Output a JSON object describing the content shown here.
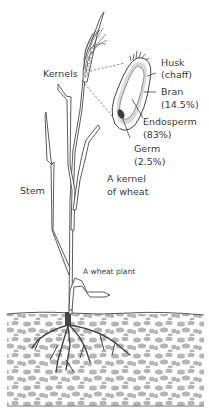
{
  "figure": {
    "title_fragment": "",
    "labels": {
      "kernels": "Kernels",
      "husk": "Husk",
      "husk_alt": "(chaff)",
      "bran": "Bran",
      "bran_pct": "(14.5%)",
      "endosperm": "Endosperm",
      "endosperm_pct": "(83%)",
      "germ": "Germ",
      "germ_pct": "(2.5%)",
      "kernel_caption_1": "A kernel",
      "kernel_caption_2": "of wheat",
      "stem": "Stem",
      "plant_caption": "A wheat plant"
    },
    "kernel_composition": [
      {
        "part": "Bran",
        "percent": 14.5
      },
      {
        "part": "Endosperm",
        "percent": 83
      },
      {
        "part": "Germ",
        "percent": 2.5
      }
    ],
    "colors": {
      "line": "#4a4a4a",
      "soil_stone": "#b3b3b3",
      "bran": "#d6d6d6",
      "germ": "#3a3a3a",
      "root": "#444444"
    }
  }
}
